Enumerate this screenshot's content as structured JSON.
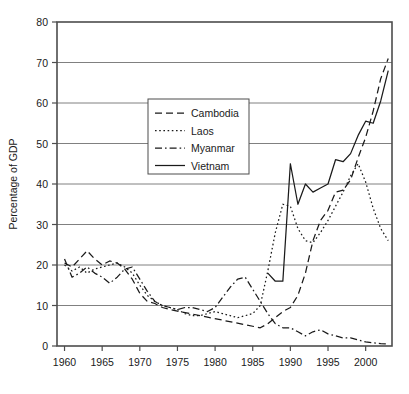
{
  "chart_data": {
    "type": "line",
    "title": "",
    "xlabel": "",
    "ylabel": "Percentage of GDP",
    "xlim": [
      1959,
      2003.5
    ],
    "ylim": [
      0,
      80
    ],
    "ytick_step": 10,
    "grid": "horizontal",
    "legend_position": "upper-center",
    "xticks": [
      "1960",
      "1965",
      "1970",
      "1975",
      "1980",
      "1985",
      "1990",
      "1995",
      "2000"
    ],
    "xtick_values": [
      1960,
      1965,
      1970,
      1975,
      1980,
      1985,
      1990,
      1995,
      2000
    ],
    "yticks": [
      "0",
      "10",
      "20",
      "30",
      "40",
      "50",
      "60",
      "70",
      "80"
    ],
    "ytick_values": [
      0,
      10,
      20,
      30,
      40,
      50,
      60,
      70,
      80
    ],
    "series": [
      {
        "name": "Cambodia",
        "dash": "dashed",
        "x": [
          1960,
          1961,
          1962,
          1963,
          1964,
          1965,
          1966,
          1967,
          1968,
          1969,
          1970,
          1971,
          1972,
          1973,
          1974,
          1986,
          1987,
          1988,
          1989,
          1990,
          1991,
          1992,
          1993,
          1994,
          1995,
          1996,
          1997,
          1998,
          1999,
          2000,
          2001,
          2002,
          2003
        ],
        "values": [
          20.5,
          19.5,
          21.5,
          23.5,
          21.5,
          20.0,
          21.0,
          20.5,
          19.0,
          16.5,
          13.0,
          11.0,
          10.5,
          9.5,
          9.0,
          4.5,
          5.5,
          7.0,
          8.5,
          9.5,
          12.5,
          18.0,
          26.0,
          31.0,
          33.5,
          38.0,
          38.5,
          41.0,
          46.5,
          51.5,
          58.0,
          66.0,
          71.0
        ]
      },
      {
        "name": "Laos",
        "dash": "dotted",
        "x": [
          1960,
          1961,
          1962,
          1963,
          1964,
          1965,
          1966,
          1967,
          1968,
          1969,
          1970,
          1971,
          1972,
          1973,
          1974,
          1975,
          1976,
          1977,
          1978,
          1979,
          1980,
          1981,
          1982,
          1983,
          1984,
          1985,
          1986,
          1987,
          1988,
          1989,
          1990,
          1991,
          1992,
          1993,
          1994,
          1995,
          1996,
          1997,
          1998,
          1999,
          2000,
          2001,
          2002,
          2003
        ],
        "values": [
          20.0,
          18.5,
          19.5,
          18.0,
          19.0,
          19.5,
          20.0,
          20.5,
          19.5,
          18.0,
          15.0,
          12.5,
          11.0,
          10.0,
          9.5,
          9.0,
          8.0,
          7.5,
          7.5,
          8.0,
          8.5,
          8.0,
          7.5,
          7.0,
          7.5,
          8.0,
          10.0,
          18.5,
          28.0,
          35.0,
          34.5,
          29.0,
          26.0,
          25.5,
          28.0,
          31.0,
          34.5,
          38.0,
          42.0,
          45.0,
          40.5,
          34.0,
          29.0,
          26.0
        ]
      },
      {
        "name": "Myanmar",
        "dash": "dashdot",
        "x": [
          1960,
          1961,
          1962,
          1963,
          1964,
          1965,
          1966,
          1967,
          1968,
          1969,
          1970,
          1971,
          1972,
          1973,
          1974,
          1975,
          1976,
          1977,
          1978,
          1979,
          1980,
          1981,
          1982,
          1983,
          1984,
          1985,
          1986,
          1987,
          1988,
          1989,
          1990,
          1991,
          1992,
          1993,
          1994,
          1995,
          1996,
          1997,
          1998,
          1999,
          2000,
          2001,
          2002,
          2003
        ],
        "values": [
          21.5,
          17.0,
          18.0,
          19.5,
          18.0,
          17.0,
          15.5,
          17.0,
          19.0,
          19.5,
          16.5,
          13.5,
          11.0,
          10.0,
          9.5,
          9.0,
          9.5,
          9.5,
          9.0,
          8.5,
          9.5,
          12.0,
          14.5,
          16.5,
          17.0,
          14.0,
          11.0,
          8.0,
          5.5,
          4.5,
          4.5,
          3.5,
          2.5,
          3.5,
          4.0,
          3.0,
          2.5,
          2.0,
          2.0,
          1.5,
          1.0,
          0.8,
          0.6,
          0.5
        ]
      },
      {
        "name": "Vietnam",
        "dash": "solid",
        "x": [
          1987,
          1988,
          1989,
          1990,
          1991,
          1992,
          1993,
          1994,
          1995,
          1996,
          1997,
          1998,
          1999,
          2000,
          2001,
          2002,
          2003
        ],
        "values": [
          18.0,
          16.0,
          16.0,
          45.0,
          35.0,
          40.0,
          38.0,
          39.0,
          40.0,
          46.0,
          45.5,
          47.5,
          52.0,
          55.5,
          55.0,
          60.5,
          68.0
        ]
      }
    ]
  },
  "legend": {
    "items": [
      {
        "label": "Cambodia"
      },
      {
        "label": "Laos"
      },
      {
        "label": "Myanmar"
      },
      {
        "label": "Vietnam"
      }
    ]
  }
}
